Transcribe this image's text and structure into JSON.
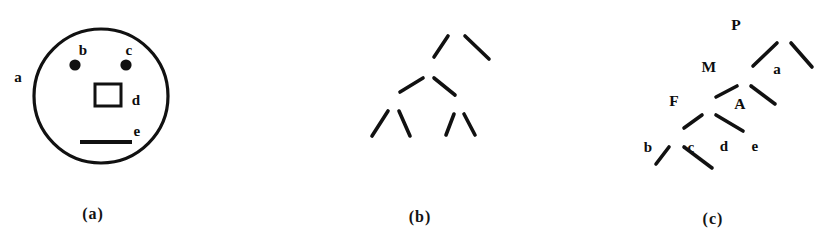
{
  "figure": {
    "background_color": "#ffffff",
    "ink_color": "#111111",
    "panels": [
      {
        "id": "a",
        "caption": "(a)",
        "caption_open": "(",
        "caption_letter": "a",
        "caption_close": ")",
        "type": "scene",
        "description": "circle containing two filled dots, an open square and a horizontal bar",
        "labels": [
          {
            "name": "a",
            "text": "a",
            "role": "whole-scene-circle",
            "x": 18,
            "y": 77
          },
          {
            "name": "b",
            "text": "b",
            "role": "left-dot",
            "x": 83,
            "y": 50
          },
          {
            "name": "c",
            "text": "c",
            "role": "right-dot",
            "x": 129,
            "y": 50
          },
          {
            "name": "d",
            "text": "d",
            "role": "square",
            "x": 136,
            "y": 100
          },
          {
            "name": "e",
            "text": "e",
            "role": "bar",
            "x": 137,
            "y": 131
          }
        ],
        "shapes": {
          "circle": {
            "cx": 101,
            "cy": 96,
            "r": 67,
            "stroke_width": 3.2
          },
          "dot_b": {
            "cx": 75,
            "cy": 65,
            "r": 5.6
          },
          "dot_c": {
            "cx": 126,
            "cy": 65,
            "r": 5.6
          },
          "square": {
            "x": 95,
            "y": 84,
            "w": 26,
            "h": 22,
            "stroke_width": 3
          },
          "bar": {
            "x1": 80,
            "y1": 142,
            "x2": 132,
            "y2": 142,
            "stroke_width": 4
          }
        }
      },
      {
        "id": "b",
        "caption": "(b)",
        "caption_open": "(",
        "caption_letter": "b",
        "caption_close": ")",
        "type": "tree",
        "description": "balanced binary tree: P over M and a; M over F and A; F over b and c; A over d and e",
        "nodes": [
          {
            "name": "P",
            "text": "P",
            "x": 456,
            "y": 25,
            "kind": "internal"
          },
          {
            "name": "M",
            "text": "M",
            "x": 429,
            "y": 67,
            "kind": "internal"
          },
          {
            "name": "a",
            "text": "a",
            "x": 497,
            "y": 69,
            "kind": "leaf"
          },
          {
            "name": "F",
            "text": "F",
            "x": 394,
            "y": 101,
            "kind": "internal"
          },
          {
            "name": "A",
            "text": "A",
            "x": 460,
            "y": 104,
            "kind": "internal"
          },
          {
            "name": "b",
            "text": "b",
            "x": 368,
            "y": 147,
            "kind": "leaf"
          },
          {
            "name": "c",
            "text": "c",
            "x": 411,
            "y": 147,
            "kind": "leaf"
          },
          {
            "name": "d",
            "text": "d",
            "x": 444,
            "y": 146,
            "kind": "leaf"
          },
          {
            "name": "e",
            "text": "e",
            "x": 475,
            "y": 146,
            "kind": "leaf"
          }
        ],
        "edges": [
          {
            "from": "P",
            "to": "M"
          },
          {
            "from": "P",
            "to": "a"
          },
          {
            "from": "M",
            "to": "F"
          },
          {
            "from": "M",
            "to": "A"
          },
          {
            "from": "F",
            "to": "b"
          },
          {
            "from": "F",
            "to": "c"
          },
          {
            "from": "A",
            "to": "d"
          },
          {
            "from": "A",
            "to": "e"
          }
        ]
      },
      {
        "id": "c",
        "caption": "(c)",
        "caption_open": "(",
        "caption_letter": "c",
        "caption_close": ")",
        "type": "tree",
        "description": "left-branching (skewed) binary tree: R over Q and a; Q over K and e; K over F and d; F over b and c",
        "nodes": [
          {
            "name": "R",
            "text": "R",
            "x": 784,
            "y": 32,
            "kind": "internal"
          },
          {
            "name": "Q",
            "text": "Q",
            "x": 744,
            "y": 77,
            "kind": "internal"
          },
          {
            "name": "a",
            "text": "a",
            "x": 816,
            "y": 79,
            "kind": "leaf"
          },
          {
            "name": "K",
            "text": "K",
            "x": 709,
            "y": 106,
            "kind": "internal"
          },
          {
            "name": "e",
            "text": "e",
            "x": 780,
            "y": 115,
            "kind": "leaf"
          },
          {
            "name": "F",
            "text": "F",
            "x": 677,
            "y": 138,
            "kind": "internal"
          },
          {
            "name": "d",
            "text": "d",
            "x": 748,
            "y": 142,
            "kind": "leaf"
          },
          {
            "name": "b",
            "text": "b",
            "x": 651,
            "y": 174,
            "kind": "leaf"
          },
          {
            "name": "c",
            "text": "c",
            "x": 717,
            "y": 178,
            "kind": "leaf"
          }
        ],
        "edges": [
          {
            "from": "R",
            "to": "Q"
          },
          {
            "from": "R",
            "to": "a"
          },
          {
            "from": "Q",
            "to": "K"
          },
          {
            "from": "Q",
            "to": "e"
          },
          {
            "from": "K",
            "to": "F"
          },
          {
            "from": "K",
            "to": "d"
          },
          {
            "from": "F",
            "to": "b"
          },
          {
            "from": "F",
            "to": "c"
          }
        ]
      }
    ],
    "captions": [
      {
        "name": "caption-a",
        "text": "(a)",
        "x": 93,
        "y": 214
      },
      {
        "name": "caption-b",
        "text": "(b)",
        "x": 420,
        "y": 217
      },
      {
        "name": "caption-c",
        "text": "(c)",
        "x": 713,
        "y": 219
      }
    ]
  }
}
